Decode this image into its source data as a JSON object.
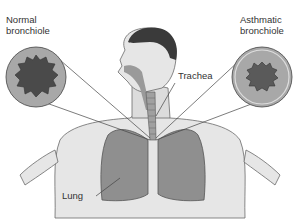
{
  "diagram": {
    "labels": {
      "normal": [
        "Normal",
        "bronchiole"
      ],
      "asthmatic": [
        "Asthmatic",
        "bronchiole"
      ],
      "trachea": "Trachea",
      "lung": "Lung"
    },
    "colors": {
      "skin": "#e6e6e6",
      "skin_outline": "#6a6a6a",
      "hair": "#3a3a3a",
      "lung": "#8f8f8f",
      "airway": "#9a9a9a",
      "circle_outer": "#a8a8a8",
      "lumen": "#4a4a4a",
      "line": "#444444"
    }
  }
}
